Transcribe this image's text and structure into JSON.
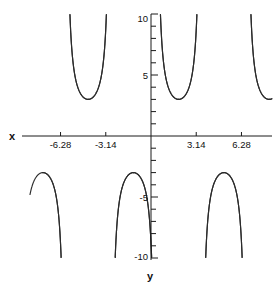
{
  "chart_data": {
    "type": "line",
    "title": "",
    "subtitle": "",
    "xlabel": "y",
    "ylabel": "x",
    "xlim": [
      -8.4,
      8.4
    ],
    "ylim": [
      -10,
      10
    ],
    "grid": false,
    "legend": null,
    "x_ticks": [
      -6.28,
      -3.14,
      3.14,
      6.28
    ],
    "x_tick_labels": [
      "-6.28",
      "-3.14",
      "3.14",
      "6.28"
    ],
    "y_ticks": [
      -10,
      -5,
      5,
      10
    ],
    "y_tick_labels": [
      "-10",
      "-5",
      "5",
      "10"
    ],
    "y_minor_tick_step": 1,
    "function": "cosecant",
    "branches_upper": [
      {
        "center": -6.28,
        "min_value": 3.0
      },
      {
        "center": -3.14,
        "min_value": 3.0
      },
      {
        "center": 0.35,
        "min_value": 3.0
      },
      {
        "center": 3.14,
        "min_value": 3.0
      },
      {
        "center": 6.28,
        "min_value": 3.0
      }
    ],
    "branches_lower": [
      {
        "center": -4.71,
        "max_value": -3.0
      },
      {
        "center": -1.57,
        "max_value": -3.0
      },
      {
        "center": 1.57,
        "max_value": -3.0
      },
      {
        "center": 4.71,
        "max_value": -3.0
      },
      {
        "center": 7.85,
        "max_value": -3.0
      }
    ],
    "axis_color": "#1a1a1a",
    "curve_color": "#2b2b2b",
    "background_color": "#ffffff"
  },
  "labels": {
    "x_axis_title": "x",
    "y_axis_title": "y"
  }
}
